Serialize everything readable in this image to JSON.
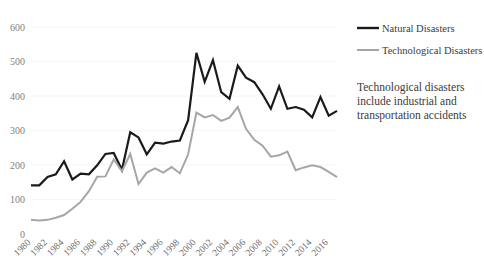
{
  "chart_data": {
    "type": "line",
    "title": "",
    "subtitle": "",
    "xlabel": "",
    "ylabel": "",
    "xlim": [
      1980,
      2017
    ],
    "ylim": [
      0,
      600
    ],
    "grid": true,
    "grid_axis": "y",
    "legend_position": "right-top",
    "x": [
      1980,
      1981,
      1982,
      1983,
      1984,
      1985,
      1986,
      1987,
      1988,
      1989,
      1990,
      1991,
      1992,
      1993,
      1994,
      1995,
      1996,
      1997,
      1998,
      1999,
      2000,
      2001,
      2002,
      2003,
      2004,
      2005,
      2006,
      2007,
      2008,
      2009,
      2010,
      2011,
      2012,
      2013,
      2014,
      2015,
      2016,
      2017
    ],
    "xticks": [
      1980,
      1982,
      1984,
      1986,
      1988,
      1990,
      1992,
      1994,
      1996,
      1998,
      2000,
      2002,
      2004,
      2006,
      2008,
      2010,
      2012,
      2014,
      2016
    ],
    "xtick_labels": [
      "1980",
      "1982",
      "1984",
      "1986",
      "1988",
      "1990",
      "1992",
      "1994",
      "1996",
      "1998",
      "2000",
      "2002",
      "2004",
      "2006",
      "2008",
      "2010",
      "2012",
      "2014",
      "2016"
    ],
    "yticks": [
      0,
      100,
      200,
      300,
      400,
      500,
      600
    ],
    "ytick_labels": [
      "0",
      "100",
      "200",
      "300",
      "400",
      "500",
      "600"
    ],
    "series": [
      {
        "name": "Natural Disasters",
        "color": "#1a1a1a",
        "width": 2.2,
        "values": [
          141,
          141,
          165,
          173,
          211,
          158,
          175,
          173,
          199,
          232,
          235,
          186,
          295,
          280,
          231,
          265,
          262,
          268,
          271,
          330,
          525,
          441,
          504,
          411,
          392,
          488,
          453,
          440,
          405,
          363,
          428,
          363,
          368,
          360,
          338,
          397,
          343,
          357
        ]
      },
      {
        "name": "Technological Disasters",
        "color": "#a6a6a6",
        "width": 2.0,
        "values": [
          41,
          39,
          41,
          47,
          55,
          73,
          93,
          124,
          166,
          167,
          216,
          182,
          232,
          145,
          178,
          190,
          178,
          194,
          176,
          231,
          352,
          338,
          345,
          328,
          337,
          368,
          305,
          273,
          256,
          224,
          228,
          239,
          185,
          193,
          199,
          194,
          180,
          165
        ]
      }
    ],
    "annotations": [
      {
        "name": "technological-note",
        "lines": [
          "Technological disasters",
          "include industrial and",
          "transportation accidents"
        ]
      }
    ]
  },
  "legend": {
    "items": [
      {
        "label": "Natural Disasters",
        "color": "#1a1a1a"
      },
      {
        "label": "Technological Disasters",
        "color": "#a6a6a6"
      }
    ]
  },
  "plot_geometry": {
    "left": 31,
    "right": 337,
    "top": 27,
    "bottom": 234,
    "legend_x": 357,
    "legend_swatch_len": 22,
    "legend_y1": 28,
    "legend_y2": 50,
    "note_x": 357,
    "note_y": 91,
    "note_line_height": 14
  }
}
